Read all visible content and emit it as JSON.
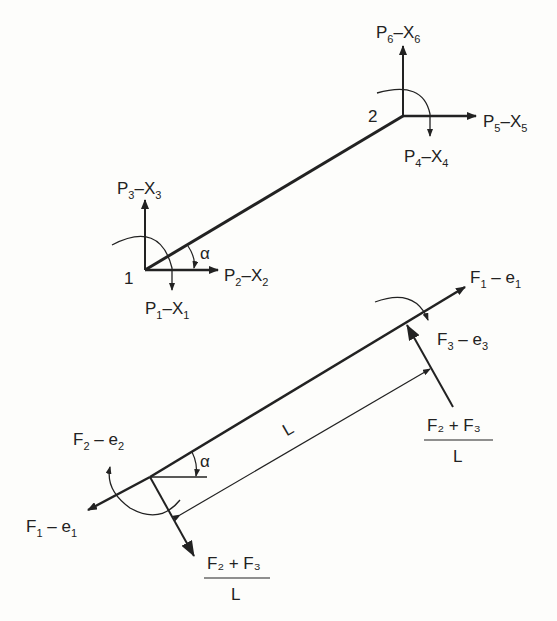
{
  "diagram": {
    "top": {
      "node1_label": "1",
      "node2_label": "2",
      "alpha": "α",
      "p1": {
        "P": "P",
        "pn": "1",
        "X": "X",
        "xn": "1"
      },
      "p2": {
        "P": "P",
        "pn": "2",
        "X": "X",
        "xn": "2"
      },
      "p3": {
        "P": "P",
        "pn": "3",
        "X": "X",
        "xn": "3"
      },
      "p4": {
        "P": "P",
        "pn": "4",
        "X": "X",
        "xn": "4"
      },
      "p5": {
        "P": "P",
        "pn": "5",
        "X": "X",
        "xn": "5"
      },
      "p6": {
        "P": "P",
        "pn": "6",
        "X": "X",
        "xn": "6"
      }
    },
    "bottom": {
      "alpha": "α",
      "length": "L",
      "f1_left": {
        "F": "F",
        "fn": "1",
        "e": "e",
        "en": "1"
      },
      "f1_right": {
        "F": "F",
        "fn": "1",
        "e": "e",
        "en": "1"
      },
      "f2": {
        "F": "F",
        "fn": "2",
        "e": "e",
        "en": "2"
      },
      "f3": {
        "F": "F",
        "fn": "3",
        "e": "e",
        "en": "3"
      },
      "shear_left": {
        "num": "F₂ + F₃",
        "den": "L"
      },
      "shear_right": {
        "num": "F₂ + F₃",
        "den": "L"
      }
    },
    "colors": {
      "ink": "#222222",
      "background": "#fdfdfb"
    }
  }
}
